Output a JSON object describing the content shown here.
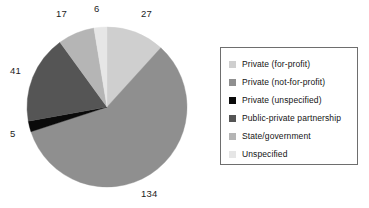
{
  "chart_data": {
    "type": "pie",
    "title": "",
    "categories": [
      "Private (for-profit)",
      "Private (not-for-profit)",
      "Private (unspecified)",
      "Public-private partnership",
      "State/government",
      "Unspecified"
    ],
    "values": [
      27,
      134,
      5,
      41,
      17,
      6
    ],
    "total": 230,
    "labels_shown": [
      "27",
      "134",
      "5",
      "41",
      "17",
      "6"
    ],
    "colors": [
      "#cfcfcf",
      "#8f8f8f",
      "#0a0a0a",
      "#555555",
      "#b5b5b5",
      "#e6e6e6"
    ],
    "start_angle_deg": 0,
    "direction": "clockwise",
    "legend_position": "right",
    "legend_border": true,
    "grid": false,
    "xlabel": "",
    "ylabel": ""
  },
  "slice_labels": [
    {
      "text": "27",
      "name": "pie-label-private-for-profit"
    },
    {
      "text": "134",
      "name": "pie-label-private-not-for-profit"
    },
    {
      "text": "5",
      "name": "pie-label-private-unspecified"
    },
    {
      "text": "41",
      "name": "pie-label-public-private-partnership"
    },
    {
      "text": "17",
      "name": "pie-label-state-government"
    },
    {
      "text": "6",
      "name": "pie-label-unspecified"
    }
  ],
  "legend": {
    "items": [
      {
        "label": "Private (for-profit)",
        "color": "#cfcfcf"
      },
      {
        "label": "Private (not-for-profit)",
        "color": "#8f8f8f"
      },
      {
        "label": "Private (unspecified)",
        "color": "#0a0a0a"
      },
      {
        "label": "Public-private partnership",
        "color": "#555555"
      },
      {
        "label": "State/government",
        "color": "#b5b5b5"
      },
      {
        "label": "Unspecified",
        "color": "#e6e6e6"
      }
    ]
  }
}
